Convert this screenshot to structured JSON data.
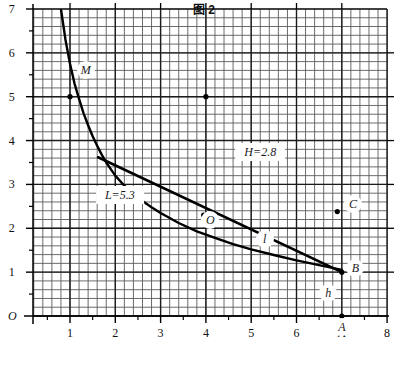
{
  "caption": "图 2",
  "chart_data": {
    "type": "line",
    "title": "图 2",
    "xlabel": "",
    "ylabel": "",
    "xlim": [
      0,
      8
    ],
    "ylim": [
      0,
      7
    ],
    "grid": true,
    "grid_minor_step": 0.2,
    "grid_major_step": 1,
    "legend": "none",
    "origin_label": "O",
    "x_ticks": [
      "1",
      "2",
      "3",
      "4",
      "5",
      "6",
      "A",
      "8"
    ],
    "x_tick_values": [
      1,
      2,
      3,
      4,
      5,
      6,
      7,
      8
    ],
    "y_ticks": [
      "1",
      "2",
      "3",
      "4",
      "5",
      "6",
      "7"
    ],
    "y_tick_values": [
      1,
      2,
      3,
      4,
      5,
      6,
      7
    ],
    "series": [
      {
        "name": "hyperbola-curve",
        "type": "curve",
        "points": [
          [
            0.8,
            7.0
          ],
          [
            0.9,
            6.3
          ],
          [
            1.0,
            5.75
          ],
          [
            1.1,
            5.3
          ],
          [
            1.2,
            4.95
          ],
          [
            1.3,
            4.62
          ],
          [
            1.4,
            4.35
          ],
          [
            1.5,
            4.1
          ],
          [
            1.6,
            3.88
          ],
          [
            1.7,
            3.68
          ],
          [
            1.8,
            3.5
          ],
          [
            1.9,
            3.35
          ],
          [
            2.0,
            3.2
          ],
          [
            2.2,
            2.97
          ],
          [
            2.4,
            2.78
          ],
          [
            2.6,
            2.62
          ],
          [
            2.8,
            2.48
          ],
          [
            3.0,
            2.35
          ],
          [
            3.4,
            2.12
          ],
          [
            3.8,
            1.93
          ],
          [
            4.2,
            1.78
          ],
          [
            4.6,
            1.64
          ],
          [
            5.0,
            1.52
          ],
          [
            5.5,
            1.39
          ],
          [
            6.0,
            1.27
          ],
          [
            6.5,
            1.16
          ],
          [
            7.0,
            1.05
          ]
        ]
      },
      {
        "name": "straight-line",
        "type": "line",
        "points": [
          [
            1.62,
            3.62
          ],
          [
            7.0,
            1.0
          ]
        ]
      }
    ],
    "points": [
      {
        "name": "point-left-upper",
        "x": 1.0,
        "y": 5.0,
        "label": ""
      },
      {
        "name": "point-M",
        "x": 4.0,
        "y": 5.0,
        "label": ""
      },
      {
        "name": "point-O-curve",
        "x": 3.95,
        "y": 2.3,
        "label": "O"
      },
      {
        "name": "point-C",
        "x": 6.9,
        "y": 2.38,
        "label": "C"
      },
      {
        "name": "point-B",
        "x": 7.0,
        "y": 1.0,
        "label": "B"
      },
      {
        "name": "point-A",
        "x": 7.0,
        "y": 0.0,
        "label": "A"
      }
    ],
    "annotations": [
      {
        "name": "label-M",
        "text": "M",
        "x": 1.35,
        "y": 5.6
      },
      {
        "name": "label-L",
        "text": "L=5.3",
        "x": 2.1,
        "y": 2.77
      },
      {
        "name": "label-H",
        "text": "H=2.8",
        "x": 5.2,
        "y": 3.75
      },
      {
        "name": "label-l",
        "text": "l",
        "x": 5.3,
        "y": 1.75
      },
      {
        "name": "label-h",
        "text": "h",
        "x": 6.7,
        "y": 0.52
      },
      {
        "name": "label-O-curve",
        "text": "O",
        "x": 4.1,
        "y": 2.18
      },
      {
        "name": "label-C",
        "text": "C",
        "x": 7.25,
        "y": 2.55
      },
      {
        "name": "label-B",
        "text": "B",
        "x": 7.3,
        "y": 1.1
      },
      {
        "name": "label-A",
        "text": "A",
        "x": 7.0,
        "y": -0.25
      }
    ],
    "colors": {
      "grid_minor": "#5a5a5a",
      "grid_major": "#1c1c1c",
      "curve": "#000000",
      "axis": "#000000",
      "background": "#ffffff"
    }
  }
}
